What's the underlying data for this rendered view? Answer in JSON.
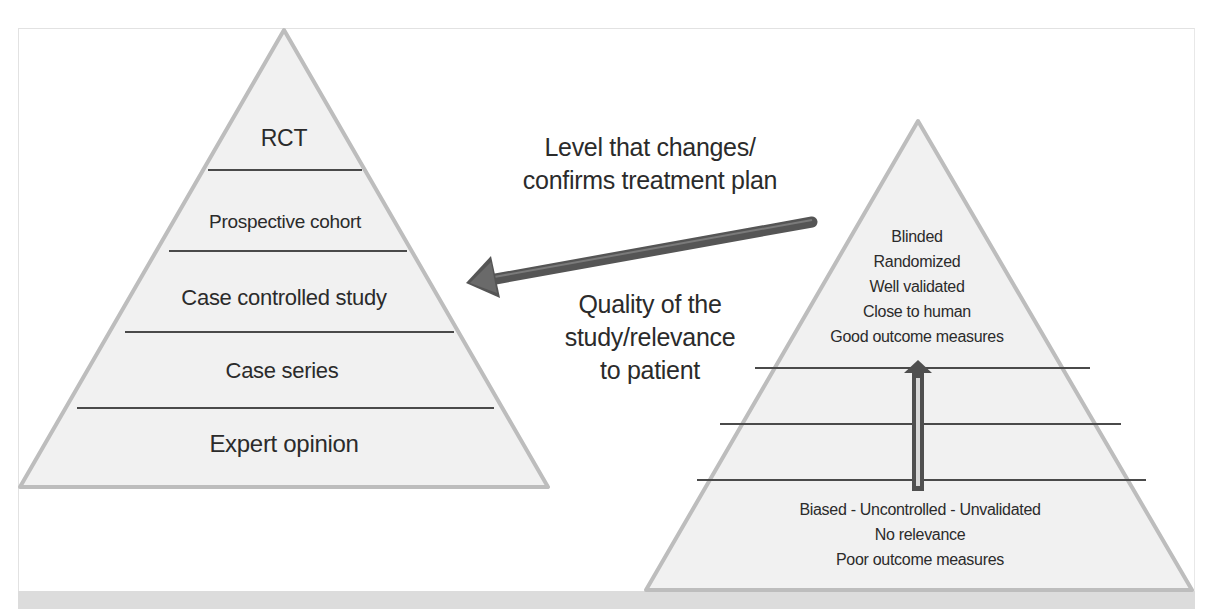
{
  "figure": {
    "colors": {
      "pyramid_fill": "#f1f1f1",
      "pyramid_outline": "#bdbdbd",
      "divider": "#4a4a4a",
      "arrow": "#555555",
      "bottom_band": "#dcdcdc",
      "text": "#2b2b2b"
    },
    "evidence_pyramid": {
      "levels": [
        {
          "label": "RCT"
        },
        {
          "label": "Prospective cohort"
        },
        {
          "label": "Case controlled study"
        },
        {
          "label": "Case series"
        },
        {
          "label": "Expert opinion"
        }
      ]
    },
    "connector": {
      "label_top": [
        "Level that changes/",
        "confirms treatment plan"
      ],
      "label_bottom": [
        "Quality of the",
        "study/relevance",
        "to patient"
      ],
      "direction": "right-to-left"
    },
    "quality_pyramid": {
      "top_criteria": [
        "Blinded",
        "Randomized",
        "Well validated",
        "Close to human",
        "Good outcome measures"
      ],
      "bottom_criteria": [
        "Biased - Uncontrolled - Unvalidated",
        "No relevance",
        "Poor outcome measures"
      ],
      "arrow_direction": "up"
    }
  }
}
